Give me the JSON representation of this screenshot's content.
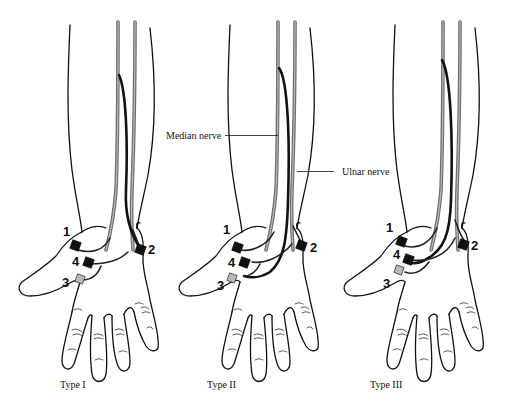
{
  "figure": {
    "panels": [
      {
        "id": "type1",
        "caption": "Type I",
        "electrodes": [
          {
            "number": "1",
            "shade": "black"
          },
          {
            "number": "2",
            "shade": "black"
          },
          {
            "number": "3",
            "shade": "grey"
          },
          {
            "number": "4",
            "shade": "black"
          }
        ]
      },
      {
        "id": "type2",
        "caption": "Type II",
        "electrodes": [
          {
            "number": "1",
            "shade": "black"
          },
          {
            "number": "2",
            "shade": "black"
          },
          {
            "number": "3",
            "shade": "grey"
          },
          {
            "number": "4",
            "shade": "black"
          }
        ]
      },
      {
        "id": "type3",
        "caption": "Type III",
        "electrodes": [
          {
            "number": "1",
            "shade": "black"
          },
          {
            "number": "2",
            "shade": "black"
          },
          {
            "number": "3",
            "shade": "grey"
          },
          {
            "number": "4",
            "shade": "black"
          }
        ]
      }
    ],
    "annotations": {
      "median_nerve": "Median nerve",
      "ulnar_nerve": "Ulnar nerve"
    },
    "colors": {
      "outline": "#111111",
      "nerve": "#6e6e6e",
      "electrode_active": "#111111",
      "electrode_reference": "#b9b9b9",
      "background": "#ffffff"
    }
  }
}
